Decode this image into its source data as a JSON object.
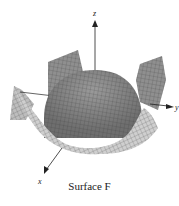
{
  "figure": {
    "caption": "Surface F",
    "axes": {
      "x_label": "x",
      "y_label": "y",
      "z_label": "z"
    },
    "colors": {
      "surface_top": "#8c8c8c",
      "surface_light": "#d4d4d4",
      "surface_mid": "#a8a8a8",
      "mesh_line": "#3a3a3a",
      "axis": "#222222",
      "background": "#ffffff"
    }
  }
}
